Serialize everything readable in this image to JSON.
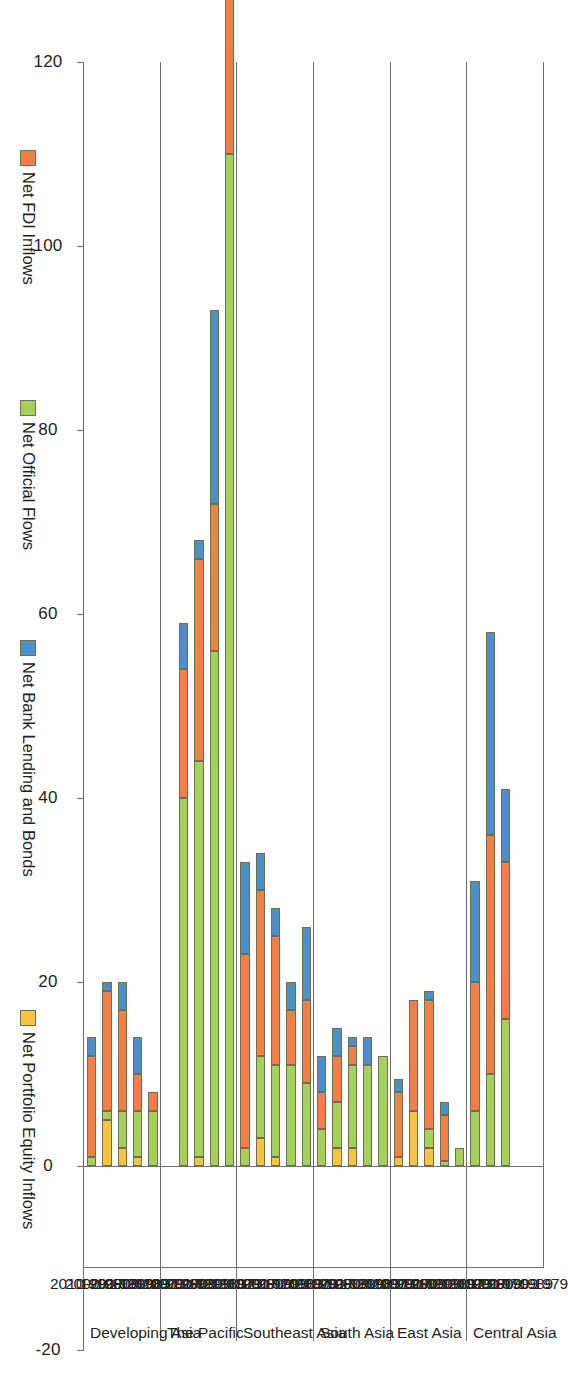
{
  "chart_data": {
    "type": "bar",
    "orientation": "horizontal-stacked",
    "title": "",
    "subtitle": "",
    "xlabel": "",
    "ylabel": "",
    "xlim": [
      -20,
      120
    ],
    "grid": false,
    "stacked": true,
    "legend_position": "bottom",
    "axis_ticks": [
      "120",
      "100",
      "80",
      "60",
      "40",
      "20",
      "0",
      "-20"
    ],
    "axis_tick_values": [
      120,
      100,
      80,
      60,
      40,
      20,
      0,
      -20
    ],
    "periods": [
      "1970-1979",
      "1980-1989",
      "1990-1999",
      "2000-2009",
      "2010-2017"
    ],
    "regions": [
      "Central Asia",
      "East Asia",
      "South Asia",
      "Southeast Asia",
      "The Pacific",
      "Developing Asia"
    ],
    "series": [
      {
        "name": "Net FDI Inflows",
        "color": "#f47f46"
      },
      {
        "name": "Net Official Flows",
        "color": "#a5d05a"
      },
      {
        "name": "Net Bank Lending and Bonds",
        "color": "#4b90c8"
      },
      {
        "name": "Net Portfolio Equity Inflows",
        "color": "#f8c440"
      }
    ],
    "groups": [
      {
        "region": "Central Asia",
        "rows": [
          {
            "period": "1970-1979",
            "values": {
              "Net FDI Inflows": 0,
              "Net Official Flows": 0,
              "Net Bank Lending and Bonds": 0,
              "Net Portfolio Equity Inflows": 0
            }
          },
          {
            "period": "1980-1989",
            "values": {
              "Net FDI Inflows": 0,
              "Net Official Flows": 0,
              "Net Bank Lending and Bonds": 0,
              "Net Portfolio Equity Inflows": 0
            }
          },
          {
            "period": "1990-1999",
            "values": {
              "Net FDI Inflows": 17,
              "Net Official Flows": 16,
              "Net Bank Lending and Bonds": 8,
              "Net Portfolio Equity Inflows": 0
            }
          },
          {
            "period": "2000-2009",
            "values": {
              "Net FDI Inflows": 26,
              "Net Official Flows": 10,
              "Net Bank Lending and Bonds": 22,
              "Net Portfolio Equity Inflows": 0
            }
          },
          {
            "period": "2010-2017",
            "values": {
              "Net FDI Inflows": 14,
              "Net Official Flows": 6,
              "Net Bank Lending and Bonds": 11,
              "Net Portfolio Equity Inflows": 0
            }
          }
        ]
      },
      {
        "region": "East Asia",
        "rows": [
          {
            "period": "1970-1979",
            "values": {
              "Net FDI Inflows": 0,
              "Net Official Flows": 2,
              "Net Bank Lending and Bonds": 0,
              "Net Portfolio Equity Inflows": 0
            }
          },
          {
            "period": "1980-1989",
            "values": {
              "Net FDI Inflows": 5,
              "Net Official Flows": 0.5,
              "Net Bank Lending and Bonds": 1.5,
              "Net Portfolio Equity Inflows": 0
            }
          },
          {
            "period": "1990-1999",
            "values": {
              "Net FDI Inflows": 14,
              "Net Official Flows": 2,
              "Net Bank Lending and Bonds": 1,
              "Net Portfolio Equity Inflows": 2
            }
          },
          {
            "period": "2000-2009",
            "values": {
              "Net FDI Inflows": 12,
              "Net Official Flows": 0,
              "Net Bank Lending and Bonds": 0,
              "Net Portfolio Equity Inflows": 6
            }
          },
          {
            "period": "2010-2017",
            "values": {
              "Net FDI Inflows": 7,
              "Net Official Flows": 0,
              "Net Bank Lending and Bonds": 1.5,
              "Net Portfolio Equity Inflows": 1
            }
          }
        ]
      },
      {
        "region": "South Asia",
        "rows": [
          {
            "period": "1970-1979",
            "values": {
              "Net FDI Inflows": 0,
              "Net Official Flows": 12,
              "Net Bank Lending and Bonds": 0,
              "Net Portfolio Equity Inflows": 0
            }
          },
          {
            "period": "1980-1989",
            "values": {
              "Net FDI Inflows": 0,
              "Net Official Flows": 11,
              "Net Bank Lending and Bonds": 3,
              "Net Portfolio Equity Inflows": 0
            }
          },
          {
            "period": "1990-1999",
            "values": {
              "Net FDI Inflows": 2,
              "Net Official Flows": 9,
              "Net Bank Lending and Bonds": 1,
              "Net Portfolio Equity Inflows": 2
            }
          },
          {
            "period": "2000-2009",
            "values": {
              "Net FDI Inflows": 5,
              "Net Official Flows": 5,
              "Net Bank Lending and Bonds": 3,
              "Net Portfolio Equity Inflows": 2
            }
          },
          {
            "period": "2010-2017",
            "values": {
              "Net FDI Inflows": 4,
              "Net Official Flows": 4,
              "Net Bank Lending and Bonds": 4,
              "Net Portfolio Equity Inflows": 0
            }
          }
        ]
      },
      {
        "region": "Southeast Asia",
        "rows": [
          {
            "period": "1970-1979",
            "values": {
              "Net FDI Inflows": 9,
              "Net Official Flows": 9,
              "Net Bank Lending and Bonds": 8,
              "Net Portfolio Equity Inflows": 0
            }
          },
          {
            "period": "1980-1989",
            "values": {
              "Net FDI Inflows": 6,
              "Net Official Flows": 11,
              "Net Bank Lending and Bonds": 3,
              "Net Portfolio Equity Inflows": 0
            }
          },
          {
            "period": "1990-1999",
            "values": {
              "Net FDI Inflows": 14,
              "Net Official Flows": 10,
              "Net Bank Lending and Bonds": 3,
              "Net Portfolio Equity Inflows": 1
            }
          },
          {
            "period": "2000-2009",
            "values": {
              "Net FDI Inflows": 18,
              "Net Official Flows": 9,
              "Net Bank Lending and Bonds": 4,
              "Net Portfolio Equity Inflows": 3
            }
          },
          {
            "period": "2010-2017",
            "values": {
              "Net FDI Inflows": 21,
              "Net Official Flows": 2,
              "Net Bank Lending and Bonds": 10,
              "Net Portfolio Equity Inflows": 0
            }
          }
        ]
      },
      {
        "region": "The Pacific",
        "rows": [
          {
            "period": "1970-1979",
            "values": {
              "Net FDI Inflows": 22,
              "Net Official Flows": 110,
              "Net Bank Lending and Bonds": 8,
              "Net Portfolio Equity Inflows": 0
            }
          },
          {
            "period": "1980-1989",
            "values": {
              "Net FDI Inflows": 16,
              "Net Official Flows": 56,
              "Net Bank Lending and Bonds": 21,
              "Net Portfolio Equity Inflows": 0
            }
          },
          {
            "period": "1990-1999",
            "values": {
              "Net FDI Inflows": 22,
              "Net Official Flows": 43,
              "Net Bank Lending and Bonds": 2,
              "Net Portfolio Equity Inflows": 1
            }
          },
          {
            "period": "2000-2009",
            "values": {
              "Net FDI Inflows": 14,
              "Net Official Flows": 40,
              "Net Bank Lending and Bonds": 5,
              "Net Portfolio Equity Inflows": 0
            }
          },
          {
            "period": "2010-2017",
            "values": {
              "Net FDI Inflows": 0,
              "Net Official Flows": 0,
              "Net Bank Lending and Bonds": 0,
              "Net Portfolio Equity Inflows": 0
            }
          }
        ]
      },
      {
        "region": "Developing Asia",
        "rows": [
          {
            "period": "1970-1979",
            "values": {
              "Net FDI Inflows": 2,
              "Net Official Flows": 6,
              "Net Bank Lending and Bonds": 0,
              "Net Portfolio Equity Inflows": 0
            }
          },
          {
            "period": "1980-1989",
            "values": {
              "Net FDI Inflows": 4,
              "Net Official Flows": 5,
              "Net Bank Lending and Bonds": 4,
              "Net Portfolio Equity Inflows": 1
            }
          },
          {
            "period": "1990-1999",
            "values": {
              "Net FDI Inflows": 11,
              "Net Official Flows": 4,
              "Net Bank Lending and Bonds": 3,
              "Net Portfolio Equity Inflows": 2
            }
          },
          {
            "period": "2000-2009",
            "values": {
              "Net FDI Inflows": 13,
              "Net Official Flows": 1,
              "Net Bank Lending and Bonds": 1,
              "Net Portfolio Equity Inflows": 5
            }
          },
          {
            "period": "2010-2017",
            "values": {
              "Net FDI Inflows": 11,
              "Net Official Flows": 1,
              "Net Bank Lending and Bonds": 2,
              "Net Portfolio Equity Inflows": 0
            }
          }
        ]
      }
    ]
  }
}
